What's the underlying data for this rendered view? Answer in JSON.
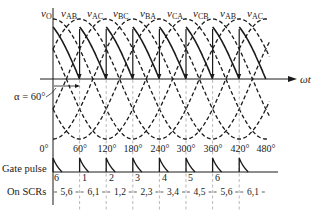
{
  "figure": {
    "y_axis_label": {
      "main": "v",
      "sub": "O"
    },
    "x_axis_label": "ωt",
    "firing_angle_label": "α = 60°",
    "voltage_labels": [
      {
        "main": "v",
        "sub": "AB"
      },
      {
        "main": "v",
        "sub": "AC"
      },
      {
        "main": "v",
        "sub": "BC"
      },
      {
        "main": "v",
        "sub": "BA"
      },
      {
        "main": "v",
        "sub": "CA"
      },
      {
        "main": "v",
        "sub": "CB"
      },
      {
        "main": "v",
        "sub": "AB"
      },
      {
        "main": "v",
        "sub": "AC"
      }
    ],
    "angle_ticks": [
      "0°",
      "60°",
      "120°",
      "180°",
      "240°",
      "300°",
      "360°",
      "420°",
      "480°"
    ],
    "gate_pulse_label": "Gate pulse",
    "gate_pulse_scr_numbers": [
      "6",
      "1",
      "2",
      "3",
      "4",
      "5",
      "6"
    ],
    "on_scrs_label": "On SCRs",
    "on_scrs_intervals": [
      "5,6",
      "6,1",
      "1,2",
      "2,3",
      "3,4",
      "4,5",
      "5,6",
      "6,1"
    ]
  }
}
